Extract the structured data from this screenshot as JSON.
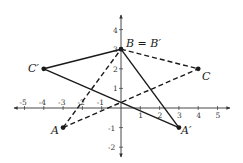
{
  "diagram": {
    "type": "coordinate-plane-rotation",
    "axes": {
      "x_ticks": [
        "-5",
        "-4",
        "-3",
        "-2",
        "-1",
        "1",
        "2",
        "3",
        "4",
        "5"
      ],
      "x_values": [
        -5,
        -4,
        -3,
        -2,
        -1,
        1,
        2,
        3,
        4,
        5
      ],
      "y_ticks": [
        "4",
        "3",
        "2",
        "1",
        "-1",
        "-2"
      ],
      "y_values": [
        4,
        3,
        2,
        1,
        -1,
        -2
      ],
      "xlim": [
        -5.5,
        5.5
      ],
      "ylim": [
        -2.5,
        4.5
      ]
    },
    "points": [
      {
        "name": "A",
        "label": "A",
        "x": -3,
        "y": -1
      },
      {
        "name": "B",
        "label": "B = B′",
        "x": 0,
        "y": 3
      },
      {
        "name": "C",
        "label": "C",
        "x": 4,
        "y": 2
      },
      {
        "name": "A-prime",
        "label": "A′",
        "x": 3,
        "y": -1
      },
      {
        "name": "C-prime",
        "label": "C′",
        "x": -4,
        "y": 2
      }
    ],
    "triangles": [
      {
        "name": "ABC",
        "style": "dashed",
        "vertices": [
          "A",
          "B",
          "C"
        ]
      },
      {
        "name": "A'B'C'",
        "style": "solid",
        "vertices": [
          "A′",
          "B′",
          "C′"
        ]
      }
    ],
    "colors": {
      "line": "#1a1a1a",
      "axis": "#333333",
      "background": "#ffffff"
    }
  }
}
